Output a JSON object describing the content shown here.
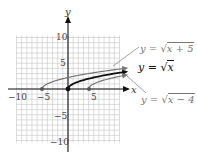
{
  "axes": {
    "x_label": "x",
    "y_label": "y",
    "x_ticks": [
      {
        "value": -10,
        "label": "−10"
      },
      {
        "value": -5,
        "label": "−5"
      },
      {
        "value": 5,
        "label": "5"
      }
    ],
    "y_ticks": [
      {
        "value": 10,
        "label": "10"
      },
      {
        "value": 5,
        "label": "5"
      },
      {
        "value": -5,
        "label": "−5"
      },
      {
        "value": -10,
        "label": "−10"
      }
    ],
    "range": {
      "x": [
        -10,
        10
      ],
      "y": [
        -10,
        10
      ]
    },
    "grid": true
  },
  "curves": [
    {
      "id": "sqrt-x-plus-5",
      "label_prefix": "y = ",
      "label_radical": "√",
      "label_arg": "x + 5",
      "start_x": -5,
      "color": "#777777"
    },
    {
      "id": "sqrt-x",
      "label_prefix": "y = ",
      "label_radical": "√",
      "label_arg": "x",
      "start_x": 0,
      "color": "#111111"
    },
    {
      "id": "sqrt-x-minus-4",
      "label_prefix": "y = ",
      "label_radical": "√",
      "label_arg": "x − 4",
      "start_x": 4,
      "color": "#777777"
    }
  ],
  "colors": {
    "grid": "#b8b8b8",
    "axis": "#111111",
    "primary_curve": "#111111",
    "shifted_curve": "#777777"
  }
}
